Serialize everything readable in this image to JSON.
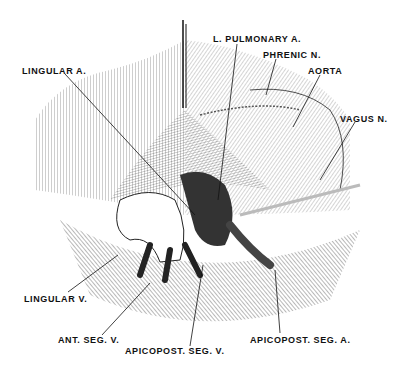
{
  "figure": {
    "labels": [
      {
        "id": "l-pulmonary-a",
        "text": "L. PULMONARY A.",
        "x": 213,
        "y": 34
      },
      {
        "id": "phrenic-n",
        "text": "PHRENIC N.",
        "x": 263,
        "y": 50
      },
      {
        "id": "aorta",
        "text": "AORTA",
        "x": 308,
        "y": 66
      },
      {
        "id": "lingular-a",
        "text": "LINGULAR A.",
        "x": 22,
        "y": 66
      },
      {
        "id": "vagus-n",
        "text": "VAGUS N.",
        "x": 340,
        "y": 114
      },
      {
        "id": "lingular-v",
        "text": "LINGULAR V.",
        "x": 24,
        "y": 294
      },
      {
        "id": "ant-seg-v",
        "text": "ANT. SEG. V.",
        "x": 58,
        "y": 335
      },
      {
        "id": "apicopost-seg-v",
        "text": "APICOPOST. SEG. V.",
        "x": 125,
        "y": 346
      },
      {
        "id": "apicopost-seg-a",
        "text": "APICOPOST. SEG. A.",
        "x": 250,
        "y": 335
      }
    ]
  }
}
